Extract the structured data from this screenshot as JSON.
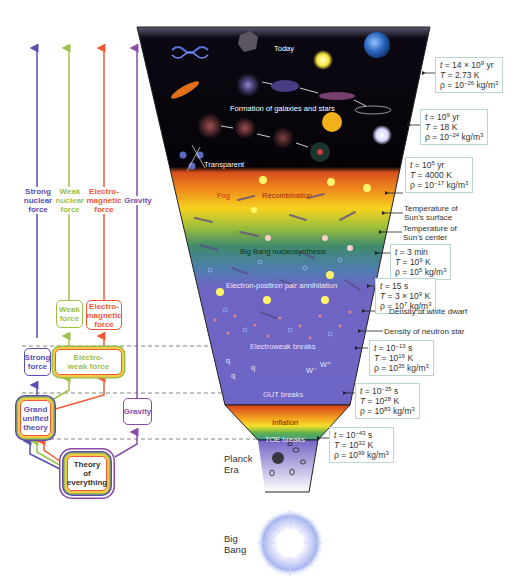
{
  "forces_top": {
    "strong": {
      "line1": "Strong",
      "line2": "nuclear",
      "line3": "force",
      "color": "#5a4fb0"
    },
    "weak": {
      "line1": "Weak",
      "line2": "nuclear",
      "line3": "force",
      "color": "#9cc04a"
    },
    "em": {
      "line1": "Electro-",
      "line2": "magnetic",
      "line3": "force",
      "color": "#ee5a35"
    },
    "gravity": {
      "line1": "Gravity",
      "color": "#8a4aa8"
    }
  },
  "boxes": {
    "weak_force": {
      "line1": "Weak",
      "line2": "force"
    },
    "em_force": {
      "line1": "Electro-",
      "line2": "magnetic",
      "line3": "force"
    },
    "strong_force": {
      "line1": "Strong",
      "line2": "force"
    },
    "electroweak": {
      "line1": "Electro-",
      "line2": "weak force"
    },
    "gut": {
      "line1": "Grand",
      "line2": "unified",
      "line3": "theory"
    },
    "gravity": {
      "line1": "Gravity"
    },
    "toe": {
      "line1": "Theory",
      "line2": "of",
      "line3": "everything"
    }
  },
  "funnel_labels": {
    "today": "Today",
    "galaxies": "Formation of galaxies and stars",
    "transparent": "Transparent",
    "fog": "Fog",
    "recombination": "Recombination",
    "nucleosynthesis": "Big Bang nucleosynthesis",
    "pair_annihilation": "Electron-positron pair annihilation",
    "electroweak_breaks": "Electroweak breaks",
    "gut_breaks": "GUT breaks",
    "inflation": "Inflation",
    "toe_breaks": "TOE breaks",
    "particles": {
      "q": "q",
      "w_minus": "W⁻",
      "w_plus": "W⁺"
    }
  },
  "eras": {
    "planck": {
      "line1": "Planck",
      "line2": "Era"
    },
    "big_bang": {
      "line1": "Big",
      "line2": "Bang"
    }
  },
  "info_boxes": [
    {
      "t": "14 × 10",
      "t_exp": "9",
      "t_unit": " yr",
      "T": "2.73 K",
      "T_exp": "",
      "T_unit": "",
      "rho": "10",
      "rho_exp": "−26",
      "rho_unit": " kg/m",
      "rho_unit_exp": "3"
    },
    {
      "t": "10",
      "t_exp": "9",
      "t_unit": " yr",
      "T": "18 K",
      "T_exp": "",
      "T_unit": "",
      "rho": "10",
      "rho_exp": "−24",
      "rho_unit": " kg/m",
      "rho_unit_exp": "3"
    },
    {
      "t": "10",
      "t_exp": "5",
      "t_unit": " yr",
      "T": "4000 K",
      "T_exp": "",
      "T_unit": "",
      "rho": "10",
      "rho_exp": "−17",
      "rho_unit": " kg/m",
      "rho_unit_exp": "3"
    },
    {
      "t": "3 min",
      "t_exp": "",
      "t_unit": "",
      "T": "10",
      "T_exp": "9",
      "T_unit": " K",
      "rho": "10",
      "rho_exp": "5",
      "rho_unit": " kg/m",
      "rho_unit_exp": "3"
    },
    {
      "t": "15 s",
      "t_exp": "",
      "t_unit": "",
      "T": "3 × 10",
      "T_exp": "9",
      "T_unit": " K",
      "rho": "10",
      "rho_exp": "7",
      "rho_unit": " kg/m",
      "rho_unit_exp": "3"
    },
    {
      "t": "10",
      "t_exp": "−13",
      "t_unit": " s",
      "T": "10",
      "T_exp": "16",
      "T_unit": " K",
      "rho": "10",
      "rho_exp": "35",
      "rho_unit": " kg/m",
      "rho_unit_exp": "3"
    },
    {
      "t": "10",
      "t_exp": "−35",
      "t_unit": " s",
      "T": "10",
      "T_exp": "28",
      "T_unit": " K",
      "rho": "10",
      "rho_exp": "83",
      "rho_unit": " kg/m",
      "rho_unit_exp": "3"
    },
    {
      "t": "10",
      "t_exp": "−43",
      "t_unit": " s",
      "T": "10",
      "T_exp": "32",
      "T_unit": " K",
      "rho": "10",
      "rho_exp": "99",
      "rho_unit": " kg/m",
      "rho_unit_exp": "3"
    }
  ],
  "symbols": {
    "t": "t",
    "T": "T",
    "rho": "ρ",
    "eq": " = "
  },
  "notes": {
    "sun_surface": {
      "line1": "Temperature of",
      "line2": "Sun's surface"
    },
    "sun_center": {
      "line1": "Temperature of",
      "line2": "Sun's center"
    },
    "white_dwarf": "Density of white dwarf",
    "neutron_star": "Density of neutron star"
  },
  "colors": {
    "strong": "#5a4fb0",
    "weak": "#9cc04a",
    "em": "#ee5a35",
    "gravity": "#8a4aa8",
    "info_border": "#b9d6cf",
    "funnel_space": "#050308",
    "funnel_purple": "#6f64c4"
  }
}
